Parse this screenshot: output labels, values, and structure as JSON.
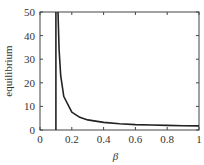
{
  "chart_data": {
    "type": "line",
    "title": "",
    "xlabel": "β",
    "ylabel": "equilibrium",
    "xlim": [
      0,
      1
    ],
    "ylim": [
      0,
      50
    ],
    "grid": false,
    "legend": null,
    "xticks": [
      0,
      0.2,
      0.4,
      0.6,
      0.8,
      1
    ],
    "xtick_labels": [
      "0",
      "0.2",
      "0.4",
      "0.6",
      "0.8",
      "1"
    ],
    "yticks": [
      0,
      10,
      20,
      30,
      40,
      50
    ],
    "ytick_labels": [
      "0",
      "10",
      "20",
      "30",
      "40",
      "50"
    ],
    "series": [
      {
        "name": "equilibrium curve",
        "color": "#222222",
        "x": [
          0.113,
          0.12,
          0.13,
          0.15,
          0.2,
          0.25,
          0.3,
          0.4,
          0.5,
          0.6,
          0.7,
          0.8,
          0.9,
          1.0
        ],
        "y": [
          50,
          34,
          23,
          14.2,
          7.6,
          5.4,
          4.3,
          3.2,
          2.65,
          2.3,
          2.1,
          1.94,
          1.83,
          1.73
        ]
      }
    ],
    "annotations": [
      {
        "type": "vertical_line",
        "x": 0.1,
        "color": "#222222"
      }
    ]
  }
}
